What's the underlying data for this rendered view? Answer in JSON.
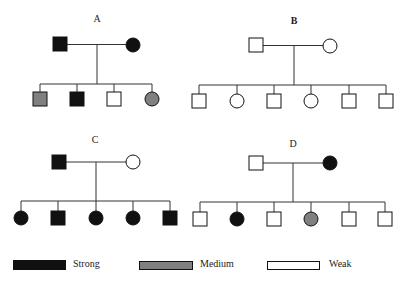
{
  "colors": {
    "strong": "#111111",
    "medium": "#808080",
    "weak": "#ffffff",
    "line": "#333333"
  },
  "pedigrees": [
    {
      "label": "A",
      "label_pos": [
        97,
        15
      ],
      "father": {
        "sex": "male",
        "expression": "strong",
        "x": 60,
        "y": 44
      },
      "mother": {
        "sex": "female",
        "expression": "strong",
        "x": 133,
        "y": 45
      },
      "drop_x": 97,
      "sibline_y": 84,
      "child_y": 99,
      "children": [
        {
          "sex": "male",
          "expression": "medium",
          "x": 40
        },
        {
          "sex": "male",
          "expression": "strong",
          "x": 77
        },
        {
          "sex": "male",
          "expression": "weak",
          "x": 114
        },
        {
          "sex": "female",
          "expression": "medium",
          "x": 152
        }
      ]
    },
    {
      "label": "B",
      "label_pos": [
        294,
        15
      ],
      "father": {
        "sex": "male",
        "expression": "weak",
        "x": 256,
        "y": 45
      },
      "mother": {
        "sex": "female",
        "expression": "weak",
        "x": 330,
        "y": 46
      },
      "drop_x": 294,
      "sibline_y": 85,
      "child_y": 101,
      "children": [
        {
          "sex": "male",
          "expression": "weak",
          "x": 199
        },
        {
          "sex": "female",
          "expression": "weak",
          "x": 237
        },
        {
          "sex": "male",
          "expression": "weak",
          "x": 274
        },
        {
          "sex": "female",
          "expression": "weak",
          "x": 311
        },
        {
          "sex": "male",
          "expression": "weak",
          "x": 349
        },
        {
          "sex": "male",
          "expression": "weak",
          "x": 386
        }
      ]
    },
    {
      "label": "C",
      "label_pos": [
        95,
        136
      ],
      "father": {
        "sex": "male",
        "expression": "strong",
        "x": 59,
        "y": 162
      },
      "mother": {
        "sex": "female",
        "expression": "weak",
        "x": 133,
        "y": 162
      },
      "drop_x": 96,
      "sibline_y": 201,
      "child_y": 218,
      "children": [
        {
          "sex": "female",
          "expression": "strong",
          "x": 21
        },
        {
          "sex": "male",
          "expression": "strong",
          "x": 58
        },
        {
          "sex": "female",
          "expression": "strong",
          "x": 96
        },
        {
          "sex": "female",
          "expression": "strong",
          "x": 133
        },
        {
          "sex": "male",
          "expression": "strong",
          "x": 170
        }
      ]
    },
    {
      "label": "D",
      "label_pos": [
        293,
        140
      ],
      "father": {
        "sex": "male",
        "expression": "weak",
        "x": 256,
        "y": 163
      },
      "mother": {
        "sex": "female",
        "expression": "strong",
        "x": 330,
        "y": 163
      },
      "drop_x": 293,
      "sibline_y": 202,
      "child_y": 219,
      "children": [
        {
          "sex": "male",
          "expression": "weak",
          "x": 200
        },
        {
          "sex": "female",
          "expression": "strong",
          "x": 237
        },
        {
          "sex": "male",
          "expression": "weak",
          "x": 274
        },
        {
          "sex": "female",
          "expression": "medium",
          "x": 311
        },
        {
          "sex": "male",
          "expression": "weak",
          "x": 349
        },
        {
          "sex": "male",
          "expression": "weak",
          "x": 385
        }
      ]
    }
  ],
  "legend": [
    {
      "key": "strong",
      "label": "Strong",
      "box_x": 13,
      "text_x": 73
    },
    {
      "key": "medium",
      "label": "Medium",
      "box_x": 139,
      "text_x": 200
    },
    {
      "key": "weak",
      "label": "Weak",
      "box_x": 267,
      "text_x": 329
    }
  ]
}
